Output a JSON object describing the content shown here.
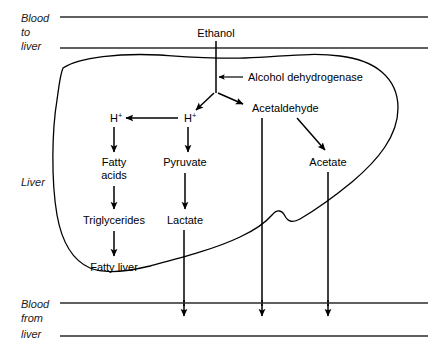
{
  "figure": {
    "width": 439,
    "height": 354,
    "background_color": "#ffffff",
    "line_color": "#000000",
    "text_color": "#000000"
  },
  "zones": {
    "top": {
      "label_line1": "Blood",
      "label_line2": "to",
      "label_line3": "liver",
      "name": "Blood to liver"
    },
    "middle": {
      "label_line1": "Liver",
      "name": "Liver"
    },
    "bottom": {
      "label_line1": "Blood",
      "label_line2": "from",
      "label_line3": "liver",
      "name": "Blood from liver"
    }
  },
  "nodes": {
    "ethanol": "Ethanol",
    "enzyme": "Alcohol dehydrogenase",
    "hplus_right": "H",
    "hplus_right_sup": "+",
    "hplus_left": "H",
    "hplus_left_sup": "+",
    "acetaldehyde": "Acetaldehyde",
    "fatty_acids_line1": "Fatty",
    "fatty_acids_line2": "acids",
    "pyruvate": "Pyruvate",
    "acetate": "Acetate",
    "triglycerides": "Triglycerides",
    "lactate": "Lactate",
    "fatty_liver": "Fatty liver"
  },
  "pathways": [
    {
      "from": "Ethanol",
      "to": "branch point",
      "type": "line"
    },
    {
      "from": "Alcohol dehydrogenase",
      "to": "Ethanol",
      "type": "arrow"
    },
    {
      "from": "branch point",
      "to": "H+",
      "type": "arrow"
    },
    {
      "from": "branch point",
      "to": "Acetaldehyde",
      "type": "arrow"
    },
    {
      "from": "H+ (right)",
      "to": "H+ (left)",
      "type": "arrow"
    },
    {
      "from": "H+ (left)",
      "to": "Fatty acids",
      "type": "arrow"
    },
    {
      "from": "Fatty acids",
      "to": "Triglycerides",
      "type": "arrow"
    },
    {
      "from": "Triglycerides",
      "to": "Fatty liver",
      "type": "arrow"
    },
    {
      "from": "H+ (right)",
      "to": "Pyruvate",
      "type": "arrow"
    },
    {
      "from": "Pyruvate",
      "to": "Lactate",
      "type": "arrow"
    },
    {
      "from": "Lactate",
      "to": "Blood from liver",
      "type": "arrow"
    },
    {
      "from": "Acetaldehyde",
      "to": "Blood from liver",
      "type": "arrow"
    },
    {
      "from": "Acetaldehyde",
      "to": "Acetate",
      "type": "arrow"
    },
    {
      "from": "Acetate",
      "to": "Blood from liver",
      "type": "arrow"
    }
  ],
  "caption": {
    "text": ""
  }
}
